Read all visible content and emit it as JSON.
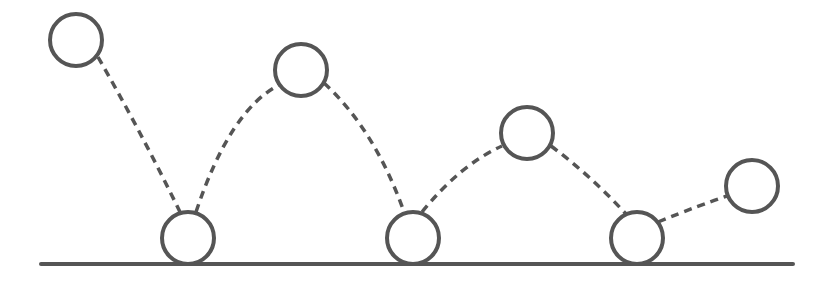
{
  "diagram": {
    "colors": {
      "stroke": "#555555",
      "background": "#ffffff"
    },
    "ground": {
      "x1": 41,
      "x2": 793,
      "y": 264,
      "width": 4
    },
    "ball_radius": 26,
    "balls": [
      {
        "cx": 76,
        "cy": 40,
        "state": "apex"
      },
      {
        "cx": 188,
        "cy": 238,
        "state": "bounce"
      },
      {
        "cx": 301,
        "cy": 70,
        "state": "apex"
      },
      {
        "cx": 413,
        "cy": 238,
        "state": "bounce"
      },
      {
        "cx": 527,
        "cy": 133,
        "state": "apex"
      },
      {
        "cx": 637,
        "cy": 238,
        "state": "bounce"
      },
      {
        "cx": 752,
        "cy": 186,
        "state": "apex"
      }
    ],
    "paths": [
      "M 98 57 Q 140 130 180 212",
      "M 196 212 Q 230 110 279 85",
      "M 324 83 Q 375 130 404 212",
      "M 422 212 Q 460 165 502 146",
      "M 551 146 Q 590 175 626 214",
      "M 658 222 Q 700 205 727 196"
    ]
  }
}
